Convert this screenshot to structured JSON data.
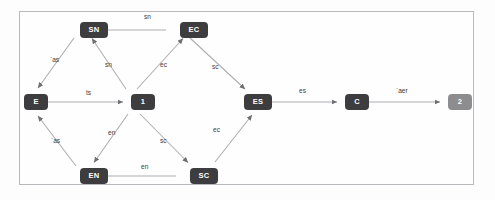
{
  "diagram": {
    "frame": {
      "border_color": "#b9b9bd",
      "background": "#fefefe"
    },
    "palette": {
      "node_dark": "#3d3d3f",
      "node_light": "#8d8d90",
      "edge": "#a9a9ad",
      "label_text": "#3c3c3c",
      "node_text": "#fdfdfd"
    },
    "nodes": [
      {
        "id": "SN",
        "label": "SN",
        "x": 80,
        "y": 22,
        "w": 28,
        "h": 16,
        "shade": "dark"
      },
      {
        "id": "EC",
        "label": "EC",
        "x": 180,
        "y": 22,
        "w": 28,
        "h": 16,
        "shade": "dark"
      },
      {
        "id": "E",
        "label": "E",
        "x": 24,
        "y": 94,
        "w": 24,
        "h": 16,
        "shade": "dark"
      },
      {
        "id": "1",
        "label": "1",
        "x": 131,
        "y": 94,
        "w": 24,
        "h": 16,
        "shade": "dark"
      },
      {
        "id": "ES",
        "label": "ES",
        "x": 244,
        "y": 94,
        "w": 28,
        "h": 16,
        "shade": "dark"
      },
      {
        "id": "C",
        "label": "C",
        "x": 345,
        "y": 94,
        "w": 24,
        "h": 16,
        "shade": "dark"
      },
      {
        "id": "2",
        "label": "2",
        "x": 448,
        "y": 94,
        "w": 24,
        "h": 16,
        "shade": "light"
      },
      {
        "id": "EN",
        "label": "EN",
        "x": 80,
        "y": 168,
        "w": 28,
        "h": 16,
        "shade": "dark"
      },
      {
        "id": "SC",
        "label": "SC",
        "x": 190,
        "y": 168,
        "w": 28,
        "h": 16,
        "shade": "dark"
      }
    ],
    "edges": [
      {
        "from": "EC",
        "to": "SN",
        "label": "sn",
        "lx": 144,
        "ly": 14
      },
      {
        "from": "E",
        "to": "SN",
        "label": "`as",
        "lx": 50,
        "ly": 57
      },
      {
        "from": "1",
        "to": "SN",
        "label": "sn",
        "lx": 105,
        "ly": 62
      },
      {
        "from": "1",
        "to": "EC",
        "label": "ec",
        "lx": 160,
        "ly": 62
      },
      {
        "from": "EC",
        "to": "ES",
        "label": "sc",
        "lx": 212,
        "ly": 64
      },
      {
        "from": "E",
        "to": "1",
        "label": "ts",
        "lx": 86,
        "ly": 90
      },
      {
        "from": "ES",
        "to": "C",
        "label": "es",
        "lx": 299,
        "ly": 88
      },
      {
        "from": "C",
        "to": "2",
        "label": "`aer",
        "lx": 396,
        "ly": 88
      },
      {
        "from": "EN",
        "to": "E",
        "label": "`as",
        "lx": 51,
        "ly": 138
      },
      {
        "from": "1",
        "to": "EN",
        "label": "en",
        "lx": 108,
        "ly": 130
      },
      {
        "from": "1",
        "to": "SC",
        "label": "sc",
        "lx": 160,
        "ly": 138
      },
      {
        "from": "SC",
        "to": "ES",
        "label": "ec",
        "lx": 213,
        "ly": 127
      },
      {
        "from": "SC",
        "to": "EN",
        "label": "en",
        "lx": 141,
        "ly": 164
      }
    ]
  }
}
